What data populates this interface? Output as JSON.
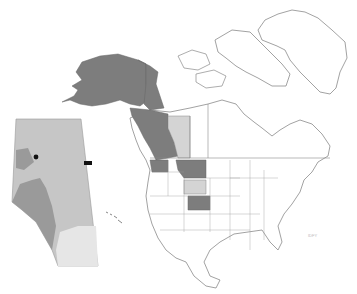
{
  "map": {
    "title": "",
    "colors": {
      "background": "#ffffff",
      "outline": "#8a8a8a",
      "dark_region": "#7d7d7d",
      "light_region": "#d4d4d4",
      "inset_base": "#c6c6c6",
      "inset_dark": "#9a9a9a",
      "inset_light": "#e6e6e6",
      "point": "#111111"
    },
    "dark_regions": [
      "Alaska",
      "Yukon",
      "British Columbia",
      "Washington",
      "Montana",
      "Colorado"
    ],
    "light_regions": [
      "Alberta",
      "Wyoming"
    ],
    "inset": {
      "region": "Alberta",
      "points": 2
    },
    "corner_label": "IDFY"
  }
}
